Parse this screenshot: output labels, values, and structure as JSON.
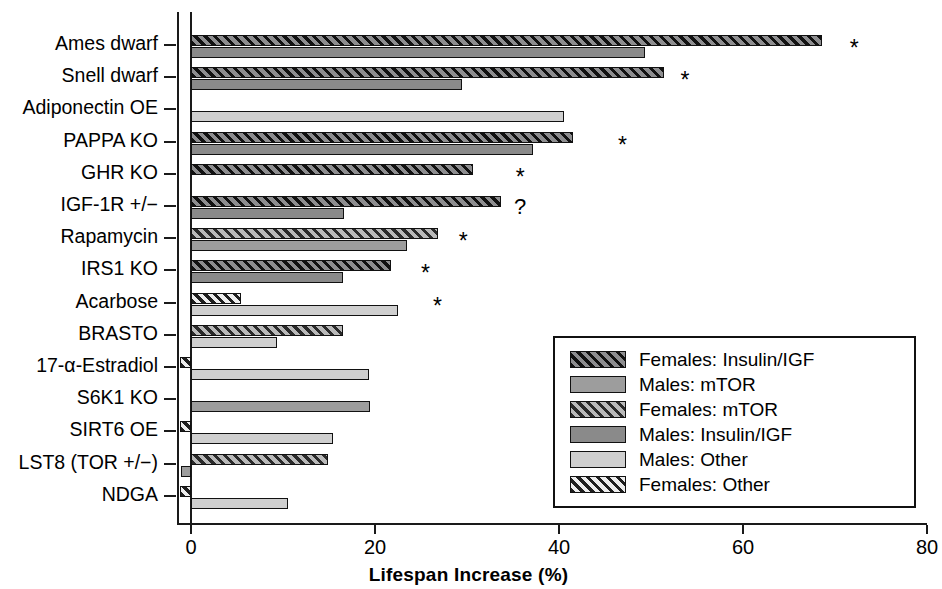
{
  "chart_data": {
    "type": "bar",
    "orientation": "horizontal",
    "title": "",
    "xlabel": "Lifespan Increase (%)",
    "ylabel": "",
    "xlim": [
      -2,
      80
    ],
    "xticks": [
      0,
      20,
      40,
      60,
      80
    ],
    "xtick_labels": [
      "0",
      "20",
      "40",
      "60",
      "80"
    ],
    "grid": false,
    "legend_position": "lower-right",
    "categories": [
      "Ames dwarf",
      "Snell dwarf",
      "Adiponectin OE",
      "PAPPA KO",
      "GHR KO",
      "IGF-1R +/−",
      "Rapamycin",
      "IRS1 KO",
      "Acarbose",
      "BRASTO",
      "17-α-Estradiol",
      "S6K1 KO",
      "SIRT6 OE",
      "LST8 (TOR +/−)",
      "NDGA"
    ],
    "series": [
      {
        "name": "Females",
        "values": [
          68.6,
          51.4,
          null,
          41.5,
          30.6,
          33.7,
          26.8,
          21.7,
          5.4,
          16.5,
          0.4,
          null,
          1.1,
          14.9,
          0.4
        ],
        "styles": [
          "fem-igf",
          "fem-igf",
          null,
          "fem-igf",
          "fem-igf",
          "fem-igf",
          "fem-mtor",
          "fem-igf",
          "fem-other",
          "fem-mtor",
          "fem-other",
          null,
          "fem-other",
          "fem-mtor",
          "fem-other"
        ]
      },
      {
        "name": "Males",
        "values": [
          49.4,
          29.5,
          40.5,
          37.2,
          null,
          16.6,
          23.5,
          16.5,
          22.5,
          9.4,
          19.3,
          19.5,
          15.4,
          -0.5,
          10.5
        ],
        "styles": [
          "mal-igf",
          "mal-igf",
          "mal-other",
          "mal-igf",
          null,
          "mal-igf",
          "mal-mtor",
          "mal-igf",
          "mal-other",
          "mal-other",
          "mal-other",
          "mal-mtor",
          "mal-other",
          "mal-mtor",
          "mal-other"
        ]
      }
    ],
    "annotations": [
      {
        "category": "Ames dwarf",
        "symbol": "*",
        "x": 71.6
      },
      {
        "category": "Snell dwarf",
        "symbol": "*",
        "x": 53.2
      },
      {
        "category": "PAPPA KO",
        "symbol": "*",
        "x": 46.4
      },
      {
        "category": "GHR KO",
        "symbol": "*",
        "x": 35.3
      },
      {
        "category": "IGF-1R +/−",
        "symbol": "?",
        "x": 35.1
      },
      {
        "category": "Rapamycin",
        "symbol": "*",
        "x": 29.1
      },
      {
        "category": "IRS1 KO",
        "symbol": "*",
        "x": 25.0
      },
      {
        "category": "Acarbose",
        "symbol": "*",
        "x": 26.3
      }
    ],
    "legend": [
      {
        "label": "Females: Insulin/IGF",
        "style": "fem-igf"
      },
      {
        "label": "Males: mTOR",
        "style": "mal-mtor"
      },
      {
        "label": "Females: mTOR",
        "style": "fem-mtor"
      },
      {
        "label": "Males: Insulin/IGF",
        "style": "mal-igf"
      },
      {
        "label": "Males: Other",
        "style": "mal-other"
      },
      {
        "label": "Females: Other",
        "style": "fem-other"
      }
    ]
  }
}
